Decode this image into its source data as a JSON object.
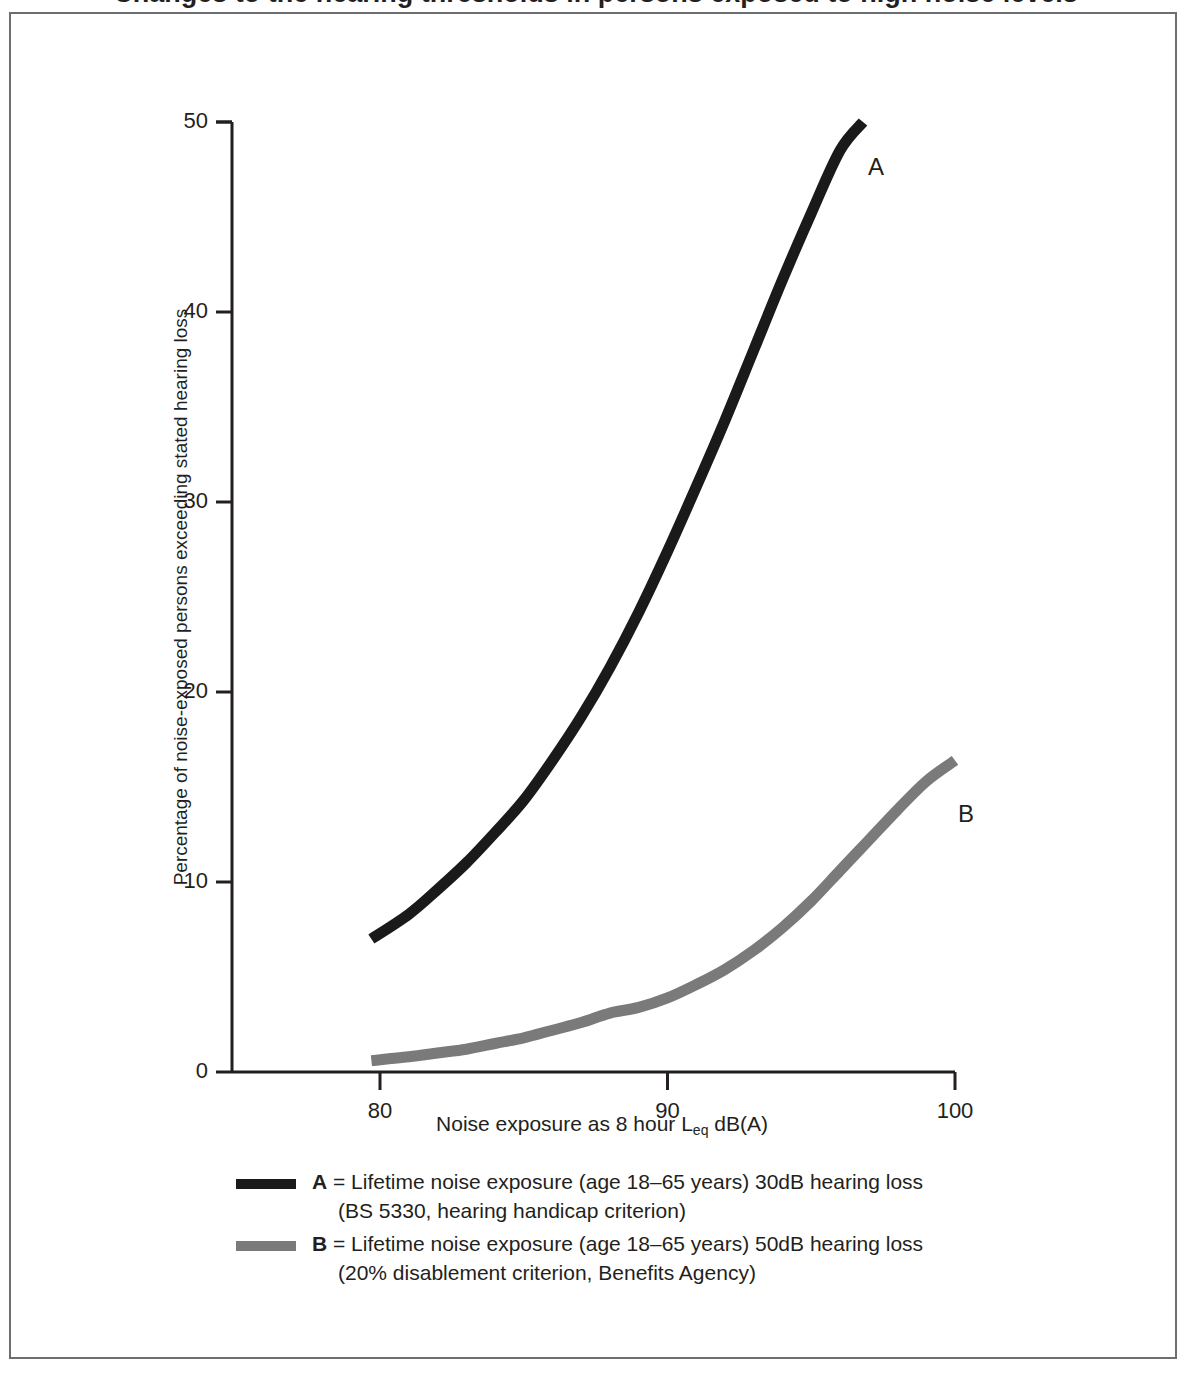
{
  "figure": {
    "title_cropped": "Changes to the hearing thresholds in persons exposed to high noise levels",
    "frame_color": "#6d6e71"
  },
  "axes": {
    "y_title": "Percentage of noise-exposed persons exceeding stated hearing loss",
    "x_title_main": "Noise exposure as 8 hour L",
    "x_title_sub": "eq",
    "x_title_tail": " dB(A)",
    "y_ticks": [
      "0",
      "10",
      "20",
      "30",
      "40",
      "50"
    ],
    "x_ticks": [
      "80",
      "90",
      "100"
    ]
  },
  "curve_labels": {
    "a": "A",
    "b": "B"
  },
  "legend": {
    "items": [
      {
        "key": "A",
        "eq": " = ",
        "line1": "Lifetime noise exposure (age 18–65 years) 30dB hearing loss",
        "line2": "(BS 5330, hearing handicap criterion)",
        "color": "#1a1a1a"
      },
      {
        "key": "B",
        "eq": " = ",
        "line1": "Lifetime noise exposure (age 18–65 years) 50dB hearing loss",
        "line2": "(20% disablement criterion, Benefits Agency)",
        "color": "#7a7a7a"
      }
    ]
  },
  "chart_data": {
    "type": "line",
    "title": "",
    "xlabel": "Noise exposure as 8 hour Leq dB(A)",
    "ylabel": "Percentage of noise-exposed persons exceeding stated hearing loss",
    "xlim": [
      76,
      101.5
    ],
    "ylim": [
      0,
      50
    ],
    "xticks": [
      80,
      90,
      100
    ],
    "yticks": [
      0,
      10,
      20,
      30,
      40,
      50
    ],
    "grid": false,
    "legend_position": "below",
    "series": [
      {
        "name": "A = Lifetime noise exposure (age 18-65 years) 30dB hearing loss (BS 5330, hearing handicap criterion)",
        "color": "#1a1a1a",
        "x": [
          79.7,
          81,
          82,
          83,
          84,
          85,
          86,
          87,
          88,
          89,
          90,
          91,
          92,
          93,
          94,
          95,
          96,
          96.8
        ],
        "y": [
          7.0,
          8.3,
          9.6,
          11.0,
          12.6,
          14.3,
          16.4,
          18.7,
          21.3,
          24.2,
          27.4,
          30.8,
          34.3,
          38.0,
          41.7,
          45.2,
          48.5,
          50.0
        ]
      },
      {
        "name": "B = Lifetime noise exposure (age 18-65 years) 50dB hearing loss (20% disablement criterion, Benefits Agency)",
        "color": "#7a7a7a",
        "x": [
          79.7,
          81,
          82,
          83,
          84,
          85,
          86,
          87,
          88,
          89,
          90,
          91,
          92,
          93,
          94,
          95,
          96,
          97,
          98,
          99,
          100
        ],
        "y": [
          0.6,
          0.8,
          1.0,
          1.2,
          1.5,
          1.8,
          2.2,
          2.6,
          3.1,
          3.4,
          3.9,
          4.6,
          5.4,
          6.4,
          7.6,
          9.0,
          10.6,
          12.2,
          13.8,
          15.3,
          16.4
        ]
      }
    ]
  }
}
